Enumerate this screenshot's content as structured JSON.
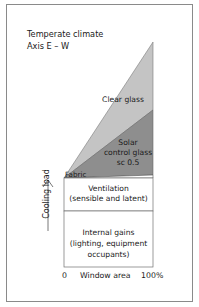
{
  "title": {
    "line1": "Temperate climate",
    "line2": "Axis E – W"
  },
  "regions": {
    "clear_glass": "Clear glass",
    "solar_control": {
      "line1": "Solar",
      "line2": "control glass",
      "line3": "sc 0.5"
    },
    "fabric": "Fabric",
    "ventilation": {
      "line1": "Ventilation",
      "line2": "(sensible and latent)"
    },
    "internal_gains": {
      "line1": "Internal gains",
      "line2": "(lighting, equipment",
      "line3": "occupants)"
    }
  },
  "axes": {
    "y_label": "Cooling load",
    "x_label": "Window area",
    "x_min": "0",
    "x_max": "100%"
  },
  "colors": {
    "clear_glass": "#c4c4c4",
    "solar_control": "#8e8e8e",
    "fabric": "#ffffff",
    "outline": "#6f6f6f"
  }
}
